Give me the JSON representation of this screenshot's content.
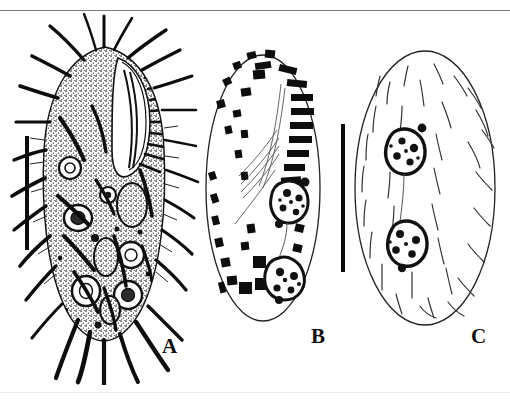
{
  "figure": {
    "type": "scientific-line-drawing",
    "background_color": "#ffffff",
    "ink_color": "#0d0d0d",
    "border": {
      "top_line_color": "#7a7a7a",
      "bottom_line_color": "#ededed"
    }
  },
  "panels": [
    {
      "id": "A",
      "label": "A",
      "label_x": 162,
      "label_y": 326,
      "description": "Ventral view of stippled, spindle-shaped ciliate with numerous stout cirri/spines projecting from the body margin, an adoral zone of membranelles along the anterior right margin, and numerous internal food vacuoles and granules",
      "body": {
        "cx": 105,
        "cy": 190,
        "rx": 58,
        "ry": 145
      },
      "features": {
        "stippling": true,
        "spines": 46,
        "food_vacuoles": 11,
        "membranelle_zone": true
      }
    },
    {
      "id": "B",
      "label": "B",
      "label_x": 311,
      "label_y": 326,
      "description": "Infraciliature of the ventral surface showing stout dark cirri arranged around the periphery, hatched adoral zone of membranelles at the anterior right, and two globular macronuclear nodules joined by a fine strand",
      "body": {
        "cx": 263,
        "cy": 188,
        "rx": 57,
        "ry": 133
      },
      "features": {
        "cirri_marks": 34,
        "membranelles": 12,
        "macronuclei": 2
      }
    },
    {
      "id": "C",
      "label": "C",
      "label_x": 471,
      "label_y": 326,
      "description": "Dorsal view showing fine curved dorsal bristles distributed over the surface and the two macronuclear nodules connected by a thin strand",
      "body": {
        "cx": 425,
        "cy": 188,
        "rx": 70,
        "ry": 137
      },
      "features": {
        "dorsal_bristles": 38,
        "macronuclei": 2
      }
    }
  ],
  "scale_bars": [
    {
      "name": "scale-bar-left",
      "x": 25,
      "y_top": 136,
      "y_bottom": 250,
      "thickness": 4,
      "color": "#0d0d0d"
    },
    {
      "name": "scale-bar-right",
      "x": 341,
      "y_top": 124,
      "y_bottom": 272,
      "thickness": 4,
      "color": "#0d0d0d"
    }
  ]
}
